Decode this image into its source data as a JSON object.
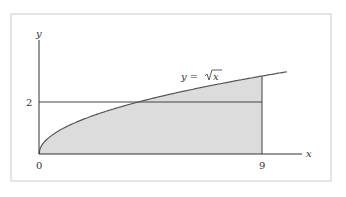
{
  "chart_data": {
    "type": "area",
    "title": "",
    "function_label": "y = √x",
    "xlabel": "x",
    "ylabel": "y",
    "x_ticks": [
      "0",
      "9"
    ],
    "y_ticks": [
      "2"
    ],
    "xlim": [
      0,
      10.5
    ],
    "ylim": [
      0,
      4.4
    ],
    "grid": false,
    "curve": {
      "name": "y = sqrt(x)",
      "x": [
        0,
        1,
        2,
        3,
        4,
        5,
        6,
        7,
        8,
        9,
        10
      ],
      "y": [
        0,
        1,
        1.414,
        1.732,
        2,
        2.236,
        2.449,
        2.646,
        2.828,
        3,
        3.162
      ]
    },
    "shaded_region": {
      "from_x": 0,
      "to_x": 9,
      "under": "y = sqrt(x)"
    },
    "horizontal_line": {
      "y": 2,
      "from_x": 0,
      "to_x": 9
    },
    "vertical_line": {
      "x": 9,
      "from_y": 0,
      "to_y": 3
    }
  },
  "labels": {
    "y_axis": "y",
    "x_axis": "x",
    "origin": "0",
    "x_tick_9": "9",
    "y_tick_2": "2",
    "curve_lhs": "y = ",
    "curve_rad": "x"
  },
  "colors": {
    "fill": "#d9d9d9",
    "line": "#555555",
    "frame": "#cccccc"
  }
}
